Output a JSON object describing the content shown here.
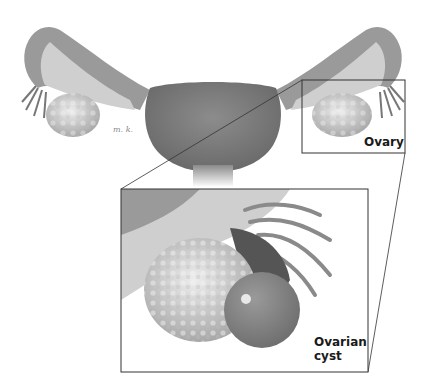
{
  "labels": {
    "ovary": "Ovary",
    "cyst_line1": "Ovarian",
    "cyst_line2": "cyst",
    "signature": "m. k."
  },
  "colors": {
    "tissue": "#8a8a8a",
    "tissue_dark": "#6e6e6e",
    "tube_light": "#c8c8c8",
    "ovary": "#d6d6d6",
    "frame": "#333333"
  }
}
